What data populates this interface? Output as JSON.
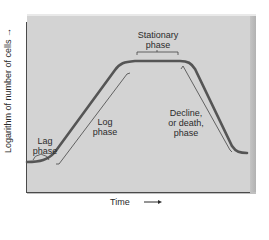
{
  "diagram": {
    "axes": {
      "x_label": "Time",
      "x_arrow": "→",
      "y_label": "Logarithm of number of cells",
      "y_arrow": "→"
    },
    "phases": [
      {
        "id": "lag",
        "label_line1": "Lag",
        "label_line2": "phase"
      },
      {
        "id": "log",
        "label_line1": "Log",
        "label_line2": "phase"
      },
      {
        "id": "stationary",
        "label_line1": "Stationary",
        "label_line2": "phase"
      },
      {
        "id": "decline",
        "label_line1": "Decline,",
        "label_line2": "or death,",
        "label_line3": "phase"
      }
    ],
    "colors": {
      "panel": "#d3d3d3",
      "curve": "#555555",
      "axis": "#4a4a4a",
      "text": "#2b2b2b"
    }
  }
}
